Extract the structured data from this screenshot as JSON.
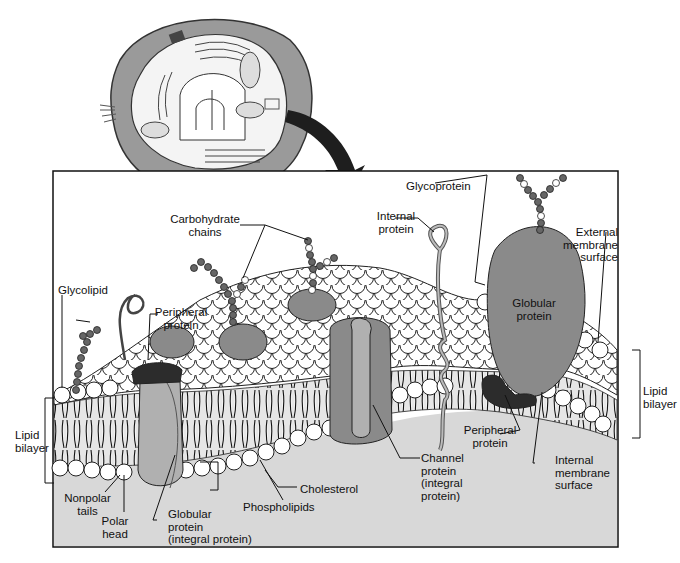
{
  "diagram": {
    "colors": {
      "frame_bg": "#d8d8d8",
      "protein": "#8a8a8a",
      "protein_light": "#b0b0b0",
      "peripheral_dark": "#2c2c2c",
      "head": "#ffffff",
      "outline": "#111111",
      "cell_wall": "#9a9a9a",
      "arrow": "#1e1e1e"
    },
    "labels": {
      "carbohydrate_chains": "Carbohydrate\nchains",
      "glycoprotein": "Glycoprotein",
      "internal_protein": "Internal\nprotein",
      "external_membrane_surface": "External\nmembrane\nsurface",
      "glycolipid": "Glycolipid",
      "peripheral_protein_top": "Peripheral\nprotein",
      "globular_protein_right": "Globular\nprotein",
      "lipid_bilayer_left": "Lipid\nbilayer",
      "lipid_bilayer_right": "Lipid\nbilayer",
      "peripheral_protein_bottom": "Peripheral\nprotein",
      "internal_membrane_surface": "Internal\nmembrane\nsurface",
      "cholesterol": "Cholesterol",
      "channel_protein": "Channel\nprotein\n(integral\nprotein)",
      "nonpolar_tails": "Nonpolar\ntails",
      "polar_head": "Polar\nhead",
      "globular_protein_integral": "Globular\nprotein\n(integral protein)",
      "phospholipids": "Phospholipids"
    }
  }
}
